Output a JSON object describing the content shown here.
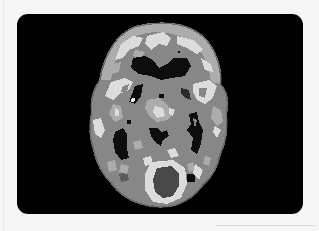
{
  "image": {
    "subject": "Axial brain scan slice (grayscale, quantized intensity levels)",
    "alt": "Axial brain scan slice",
    "frame": {
      "background": "#000000",
      "corner_radius_px": 11
    },
    "page_background": "#f6f6f6",
    "palette": {
      "background": "#000000",
      "tissue_dark": "#5c5c5c",
      "tissue_mid": "#878787",
      "tissue_light": "#acacac",
      "tissue_bright": "#dcdcdc",
      "cavity": "#0a0a0a"
    }
  }
}
